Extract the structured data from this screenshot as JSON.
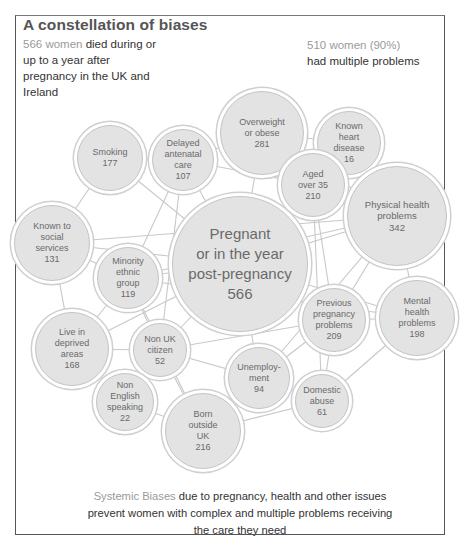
{
  "header": {
    "title": "A constellation of biases",
    "intro_highlight": "566 women",
    "intro_text": " died during or up to a year after pregnancy in the UK and Ireland",
    "multi_highlight": "510 women (90%)",
    "multi_text": " had multiple problems"
  },
  "footer": {
    "highlight": "Systemic Biases",
    "text": " due to pregnancy, health and other issues prevent women with complex and multiple problems receiving the care they need"
  },
  "colors": {
    "node_fill": "#e3e3e3",
    "node_border": "#c4c4c4",
    "link": "#c8c8c8",
    "text": "#6a6a6a",
    "highlight": "#9a9a9a"
  },
  "nodes": [
    {
      "id": "overweight",
      "label": "Overweight\nor obese\n281",
      "name": "Overweight or obese",
      "value": 281,
      "cx": 262,
      "cy": 133,
      "r": 42
    },
    {
      "id": "heart",
      "label": "Known\nheart\ndisease\n16",
      "name": "Known heart disease",
      "value": 16,
      "cx": 349,
      "cy": 143,
      "r": 32
    },
    {
      "id": "smoking",
      "label": "Smoking\n177",
      "name": "Smoking",
      "value": 177,
      "cx": 110,
      "cy": 158,
      "r": 33
    },
    {
      "id": "antenatal",
      "label": "Delayed\nantenatal\ncare\n107",
      "name": "Delayed antenatal care",
      "value": 107,
      "cx": 183,
      "cy": 160,
      "r": 31
    },
    {
      "id": "aged35",
      "label": "Aged\nover 35\n210",
      "name": "Aged over 35",
      "value": 210,
      "cx": 313,
      "cy": 185,
      "r": 32
    },
    {
      "id": "physical",
      "label": "Physical health\nproblems\n342",
      "name": "Physical health problems",
      "value": 342,
      "cx": 397,
      "cy": 216,
      "r": 50
    },
    {
      "id": "social",
      "label": "Known to\nsocial\nservices\n131",
      "name": "Known to social services",
      "value": 131,
      "cx": 52,
      "cy": 243,
      "r": 38
    },
    {
      "id": "pregnant",
      "label": "Pregnant\nor in the year\npost-pregnancy\n566",
      "name": "Pregnant or in the year post-pregnancy",
      "value": 566,
      "cx": 240,
      "cy": 264,
      "r": 68
    },
    {
      "id": "minority",
      "label": "Minority\nethnic\ngroup\n119",
      "name": "Minority ethnic group",
      "value": 119,
      "cx": 128,
      "cy": 278,
      "r": 31
    },
    {
      "id": "prevpreg",
      "label": "Previous\npregnancy\nproblems\n209",
      "name": "Previous pregnancy problems",
      "value": 209,
      "cx": 334,
      "cy": 320,
      "r": 32
    },
    {
      "id": "mental",
      "label": "Mental\nhealth\nproblems\n198",
      "name": "Mental health problems",
      "value": 198,
      "cx": 417,
      "cy": 318,
      "r": 38
    },
    {
      "id": "deprived",
      "label": "Live in\ndeprived\nareas\n168",
      "name": "Live in deprived areas",
      "value": 168,
      "cx": 72,
      "cy": 349,
      "r": 37
    },
    {
      "id": "nonuk",
      "label": "Non UK\ncitizen\n52",
      "name": "Non UK citizen",
      "value": 52,
      "cx": 160,
      "cy": 350,
      "r": 27
    },
    {
      "id": "unemployment",
      "label": "Unemploy-\nment\n94",
      "name": "Unemployment",
      "value": 94,
      "cx": 259,
      "cy": 378,
      "r": 31
    },
    {
      "id": "domestic",
      "label": "Domestic\nabuse\n61",
      "name": "Domestic abuse",
      "value": 61,
      "cx": 322,
      "cy": 401,
      "r": 27
    },
    {
      "id": "nonenglish",
      "label": "Non\nEnglish\nspeaking\n22",
      "name": "Non English speaking",
      "value": 22,
      "cx": 125,
      "cy": 402,
      "r": 29
    },
    {
      "id": "bornoutside",
      "label": "Born\noutside\nUK\n216",
      "name": "Born outside UK",
      "value": 216,
      "cx": 203,
      "cy": 431,
      "r": 38
    }
  ],
  "links": [
    [
      "overweight",
      "heart"
    ],
    [
      "overweight",
      "antenatal"
    ],
    [
      "overweight",
      "aged35"
    ],
    [
      "overweight",
      "pregnant"
    ],
    [
      "overweight",
      "physical"
    ],
    [
      "heart",
      "physical"
    ],
    [
      "heart",
      "aged35"
    ],
    [
      "smoking",
      "antenatal"
    ],
    [
      "smoking",
      "social"
    ],
    [
      "smoking",
      "pregnant"
    ],
    [
      "antenatal",
      "pregnant"
    ],
    [
      "antenatal",
      "minority"
    ],
    [
      "antenatal",
      "aged35"
    ],
    [
      "antenatal",
      "nonuk"
    ],
    [
      "aged35",
      "physical"
    ],
    [
      "aged35",
      "pregnant"
    ],
    [
      "aged35",
      "prevpreg"
    ],
    [
      "aged35",
      "domestic"
    ],
    [
      "physical",
      "pregnant"
    ],
    [
      "physical",
      "mental"
    ],
    [
      "physical",
      "prevpreg"
    ],
    [
      "physical",
      "minority"
    ],
    [
      "physical",
      "unemployment"
    ],
    [
      "social",
      "minority"
    ],
    [
      "social",
      "pregnant"
    ],
    [
      "social",
      "deprived"
    ],
    [
      "social",
      "physical"
    ],
    [
      "pregnant",
      "minority"
    ],
    [
      "pregnant",
      "prevpreg"
    ],
    [
      "pregnant",
      "nonuk"
    ],
    [
      "pregnant",
      "unemployment"
    ],
    [
      "pregnant",
      "mental"
    ],
    [
      "pregnant",
      "deprived"
    ],
    [
      "minority",
      "deprived"
    ],
    [
      "minority",
      "nonuk"
    ],
    [
      "minority",
      "mental"
    ],
    [
      "minority",
      "bornoutside"
    ],
    [
      "prevpreg",
      "mental"
    ],
    [
      "prevpreg",
      "domestic"
    ],
    [
      "prevpreg",
      "unemployment"
    ],
    [
      "prevpreg",
      "nonuk"
    ],
    [
      "mental",
      "domestic"
    ],
    [
      "deprived",
      "nonuk"
    ],
    [
      "deprived",
      "nonenglish"
    ],
    [
      "nonuk",
      "nonenglish"
    ],
    [
      "nonuk",
      "bornoutside"
    ],
    [
      "nonuk",
      "unemployment"
    ],
    [
      "unemployment",
      "domestic"
    ],
    [
      "unemployment",
      "bornoutside"
    ],
    [
      "domestic",
      "bornoutside"
    ],
    [
      "nonenglish",
      "bornoutside"
    ]
  ]
}
